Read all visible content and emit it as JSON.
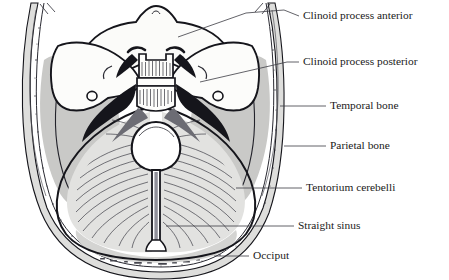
{
  "figure": {
    "view": "axial section of skull, superior aspect",
    "background_color": "#ffffff",
    "line_color": "#14141a",
    "fill_colors": {
      "skull_diploe": "#d8d8d6",
      "middle_cranial_fossa": "#c9c9c7",
      "tentorium": "#e0e0de",
      "posterior_fossa_shade": "#d2d2d0",
      "bone_light": "#fafaf8",
      "foramen_magnum": "#ffffff",
      "straight_sinus": "#8e8e90"
    }
  },
  "labels": [
    {
      "id": "clinoid-process-anterior",
      "text": "Clinoid process anterior",
      "text_x": 303,
      "text_y": 16,
      "leader": "M299,16 L286,10 L246,13 L176,38"
    },
    {
      "id": "clinoid-process-posterior",
      "text": "Clinoid process posterior",
      "text_x": 303,
      "text_y": 62,
      "leader": "M299,62 L287,62 L200,82"
    },
    {
      "id": "temporal-bone",
      "text": "Temporal bone",
      "text_x": 330,
      "text_y": 106,
      "leader": "M326,106 L280,106"
    },
    {
      "id": "parietal-bone",
      "text": "Parietal bone",
      "text_x": 330,
      "text_y": 146,
      "leader": "M326,146 L284,146"
    },
    {
      "id": "tentorium-cerebelli",
      "text": "Tentorium cerebelli",
      "text_x": 306,
      "text_y": 188,
      "leader": "M302,188 L236,188"
    },
    {
      "id": "straight-sinus",
      "text": "Straight sinus",
      "text_x": 298,
      "text_y": 226,
      "leader": "M294,226 L166,226"
    },
    {
      "id": "occiput",
      "text": "Occiput",
      "text_x": 253,
      "text_y": 256,
      "leader": "M249,256 L215,256"
    }
  ],
  "structures": [
    {
      "id": "skull-vault-outer",
      "name": "outer table of cranial vault"
    },
    {
      "id": "skull-vault-inner",
      "name": "inner table of cranial vault"
    },
    {
      "id": "diploe-band",
      "name": "diploe / speckled bone band"
    },
    {
      "id": "lesser-wing-sphenoid-left",
      "name": "lesser wing of sphenoid, left"
    },
    {
      "id": "lesser-wing-sphenoid-right",
      "name": "lesser wing of sphenoid, right"
    },
    {
      "id": "sella-turcica",
      "name": "sella turcica with dorsum sellae"
    },
    {
      "id": "petrous-ridge-left",
      "name": "petrous ridge, left"
    },
    {
      "id": "petrous-ridge-right",
      "name": "petrous ridge, right"
    },
    {
      "id": "tentorium-left-leaf",
      "name": "tentorium cerebelli, left leaf"
    },
    {
      "id": "tentorium-right-leaf",
      "name": "tentorium cerebelli, right leaf"
    },
    {
      "id": "tentorial-incisure",
      "name": "tentorial incisure / foramen magnum opening"
    },
    {
      "id": "straight-sinus-band",
      "name": "straight sinus in midline"
    },
    {
      "id": "middle-cranial-fossa-left",
      "name": "middle cranial fossa, left"
    },
    {
      "id": "middle-cranial-fossa-right",
      "name": "middle cranial fossa, right"
    }
  ]
}
